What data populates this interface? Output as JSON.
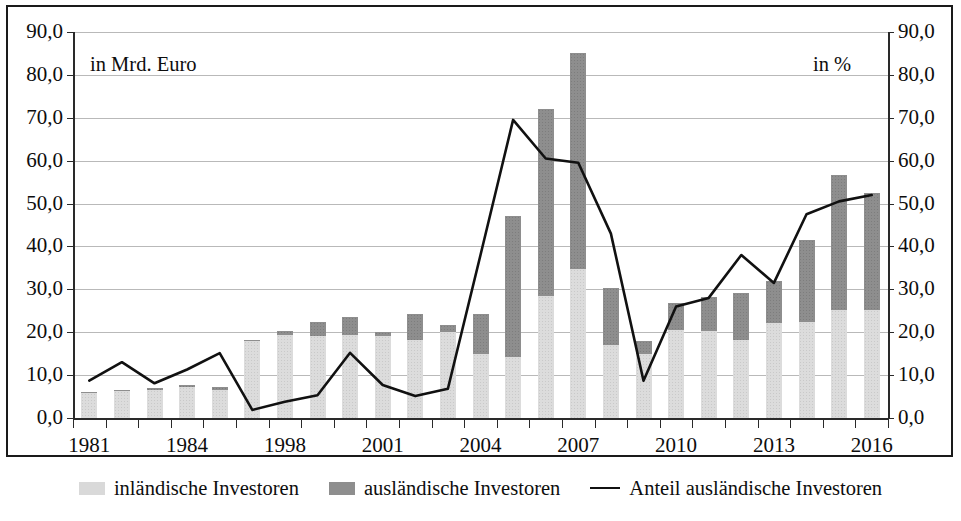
{
  "annotations": {
    "left_unit": "in Mrd. Euro",
    "right_unit": "in %"
  },
  "legend": {
    "items": [
      {
        "label": "inländische Investoren",
        "marker": "swatch-light-gray",
        "color": "#dcdcdc"
      },
      {
        "label": "ausländische Investoren",
        "marker": "swatch-dark-gray",
        "color": "#8e8e8e"
      },
      {
        "label": "Anteil ausländische Investoren",
        "marker": "line-black",
        "color": "#111111"
      }
    ]
  },
  "chart_data": {
    "type": "bar",
    "title": "",
    "subtitle": "",
    "xlabel": "",
    "ylabel": "in Mrd. Euro",
    "y2label": "in %",
    "ylim": [
      0,
      90
    ],
    "y2lim": [
      0,
      90
    ],
    "yticks": [
      "0,0",
      "10,0",
      "20,0",
      "30,0",
      "40,0",
      "50,0",
      "60,0",
      "70,0",
      "80,0",
      "90,0"
    ],
    "y2ticks": [
      "0,0",
      "10,0",
      "20,0",
      "30,0",
      "40,0",
      "50,0",
      "60,0",
      "70,0",
      "80,0",
      "90,0"
    ],
    "grid": true,
    "legend_position": "bottom",
    "stacked": true,
    "categories": [
      "1981",
      "1982",
      "1983",
      "1984",
      "1985",
      "1997",
      "1998",
      "1999",
      "2000",
      "2001",
      "2002",
      "2003",
      "2004",
      "2005",
      "2006",
      "2007",
      "2008",
      "2009",
      "2010",
      "2011",
      "2012",
      "2013",
      "2014",
      "2015",
      "2016"
    ],
    "xtick_labels": [
      "1981",
      "",
      "",
      "1984",
      "",
      "",
      "1998",
      "",
      "",
      "2001",
      "",
      "",
      "2004",
      "",
      "",
      "2007",
      "",
      "",
      "2010",
      "",
      "",
      "2013",
      "",
      "",
      "2016"
    ],
    "series": [
      {
        "name": "inländische Investoren",
        "color": "#dcdcdc",
        "values": [
          5.8,
          6.2,
          6.5,
          7.2,
          6.6,
          17.9,
          19.4,
          19.0,
          19.3,
          19.1,
          18.3,
          20.0,
          15.0,
          14.3,
          28.5,
          34.8,
          17.1,
          15.0,
          20.5,
          20.4,
          18.2,
          22.1,
          22.4,
          25.2,
          25.1
        ]
      },
      {
        "name": "ausländische Investoren",
        "color": "#8e8e8e",
        "values": [
          0.3,
          0.4,
          0.4,
          0.5,
          0.6,
          0.2,
          0.9,
          3.3,
          4.3,
          0.9,
          5.9,
          1.6,
          9.3,
          32.9,
          43.6,
          50.2,
          13.2,
          3.0,
          6.2,
          7.8,
          10.9,
          9.8,
          19.1,
          31.4,
          27.4
        ]
      }
    ],
    "line_series": {
      "name": "Anteil ausländische Investoren",
      "color": "#111111",
      "axis": "right",
      "unit": "%",
      "values": [
        8.7,
        13.0,
        8.1,
        11.3,
        15.1,
        1.9,
        3.8,
        5.3,
        15.2,
        7.7,
        5.1,
        6.8,
        38.0,
        69.5,
        60.5,
        59.5,
        43.0,
        8.7,
        26.0,
        28.0,
        38.0,
        31.5,
        47.5,
        50.5,
        52.0
      ]
    }
  }
}
